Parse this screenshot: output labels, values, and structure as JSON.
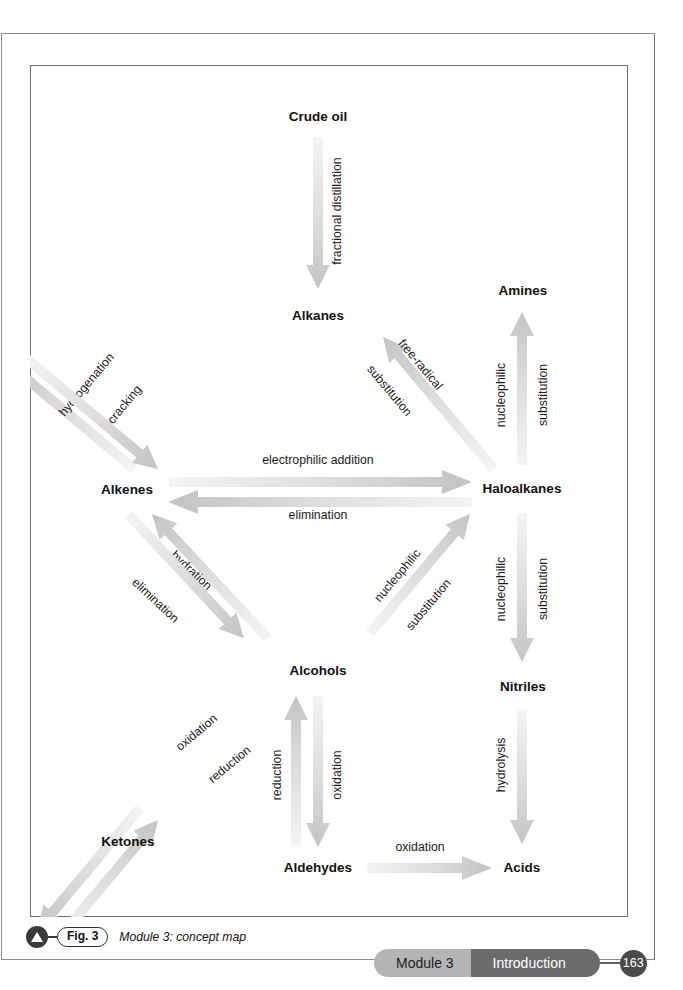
{
  "figure": {
    "nodes": [
      {
        "id": "crude-oil",
        "label": "Crude oil",
        "x": 288,
        "y": 52
      },
      {
        "id": "alkanes",
        "label": "Alkanes",
        "x": 288,
        "y": 251
      },
      {
        "id": "amines",
        "label": "Amines",
        "x": 493,
        "y": 226
      },
      {
        "id": "alkenes",
        "label": "Alkenes",
        "x": 97,
        "y": 425
      },
      {
        "id": "haloalkanes",
        "label": "Haloalkanes",
        "x": 492,
        "y": 424
      },
      {
        "id": "alcohols",
        "label": "Alcohols",
        "x": 288,
        "y": 606
      },
      {
        "id": "nitriles",
        "label": "Nitriles",
        "x": 493,
        "y": 622
      },
      {
        "id": "ketones",
        "label": "Ketones",
        "x": 98,
        "y": 777
      },
      {
        "id": "aldehydes",
        "label": "Aldehydes",
        "x": 288,
        "y": 803
      },
      {
        "id": "acids",
        "label": "Acids",
        "x": 492,
        "y": 803
      }
    ],
    "edges": [
      {
        "id": "crude-oil-to-alkanes",
        "from": "crude-oil",
        "to": "alkanes",
        "labels": [
          "fractional distillation"
        ]
      },
      {
        "id": "alkenes-to-alkanes",
        "from": "alkenes",
        "to": "alkanes",
        "labels": [
          "hydrogenation"
        ]
      },
      {
        "id": "alkanes-to-alkenes",
        "from": "alkanes",
        "to": "alkenes",
        "labels": [
          "cracking"
        ]
      },
      {
        "id": "alkanes-to-haloalkanes",
        "from": "alkanes",
        "to": "haloalkanes",
        "labels": [
          "free-radical",
          "substitution"
        ]
      },
      {
        "id": "alkenes-to-haloalkanes",
        "from": "alkenes",
        "to": "haloalkanes",
        "labels": [
          "electrophilic addition"
        ]
      },
      {
        "id": "haloalkanes-to-alkenes",
        "from": "haloalkanes",
        "to": "alkenes",
        "labels": [
          "elimination"
        ]
      },
      {
        "id": "haloalkanes-to-amines",
        "from": "haloalkanes",
        "to": "amines",
        "labels": [
          "nucleophilic",
          "substitution"
        ]
      },
      {
        "id": "alkenes-to-alcohols",
        "from": "alkenes",
        "to": "alcohols",
        "labels": [
          "hydration"
        ]
      },
      {
        "id": "alcohols-to-alkenes",
        "from": "alcohols",
        "to": "alkenes",
        "labels": [
          "elimination"
        ]
      },
      {
        "id": "haloalkanes-to-alcohols",
        "from": "haloalkanes",
        "to": "alcohols",
        "labels": [
          "nucleophilic",
          "substitution"
        ]
      },
      {
        "id": "haloalkanes-to-nitriles",
        "from": "haloalkanes",
        "to": "nitriles",
        "labels": [
          "nucleophilic",
          "substitution"
        ]
      },
      {
        "id": "alcohols-to-ketones",
        "from": "alcohols",
        "to": "ketones",
        "labels": [
          "reduction"
        ]
      },
      {
        "id": "ketones-to-alcohols",
        "from": "ketones",
        "to": "alcohols",
        "labels": [
          "oxidation"
        ]
      },
      {
        "id": "aldehydes-to-alcohols",
        "from": "aldehydes",
        "to": "alcohols",
        "labels": [
          "reduction"
        ]
      },
      {
        "id": "alcohols-to-aldehydes",
        "from": "alcohols",
        "to": "aldehydes",
        "labels": [
          "oxidation"
        ]
      },
      {
        "id": "nitriles-to-acids",
        "from": "nitriles",
        "to": "acids",
        "labels": [
          "hydrolysis"
        ]
      },
      {
        "id": "aldehydes-to-acids",
        "from": "aldehydes",
        "to": "acids",
        "labels": [
          "oxidation"
        ]
      }
    ]
  },
  "caption": {
    "figure_number": "Fig. 3",
    "text": "Module 3: concept map"
  },
  "footer": {
    "module": "Module 3",
    "section": "Introduction",
    "page_number": "163"
  },
  "colors": {
    "arrow_head": "#c9c9c9",
    "arrow_tail": "#f2f2f2",
    "text": "#111111",
    "footer_module_bg": "#b4b4b4",
    "footer_section_bg": "#6b6b6b",
    "page_number_bg": "#4a4a4a"
  }
}
